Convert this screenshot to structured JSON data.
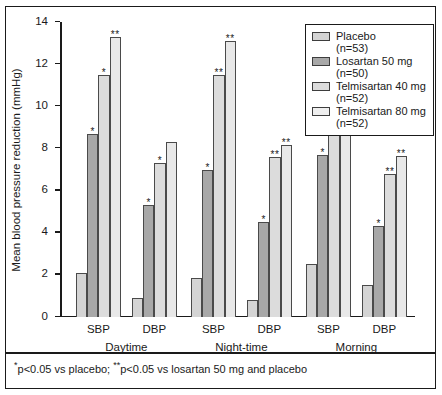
{
  "chart_data": {
    "type": "bar",
    "title": "",
    "xlabel": "",
    "ylabel": "Mean blood pressure reduction (mmHg)",
    "ylim": [
      0,
      14
    ],
    "yticks": [
      0,
      2,
      4,
      6,
      8,
      10,
      12,
      14
    ],
    "ytick_labels": [
      "0",
      "2",
      "4",
      "6",
      "8",
      "10",
      "12",
      "14"
    ],
    "grid": false,
    "legend_position": "top-right",
    "categories": [
      "Daytime SBP",
      "Daytime DBP",
      "Night-time SBP",
      "Night-time DBP",
      "Morning SBP",
      "Morning DBP"
    ],
    "groups": [
      {
        "name": "Daytime",
        "measures": [
          "SBP",
          "DBP"
        ]
      },
      {
        "name": "Night-time",
        "measures": [
          "SBP",
          "DBP"
        ]
      },
      {
        "name": "Morning",
        "measures": [
          "SBP",
          "DBP"
        ]
      }
    ],
    "series": [
      {
        "name": "Placebo",
        "n_label": "(n=53)",
        "color": "#d4d4d4",
        "values": [
          2.1,
          0.9,
          1.85,
          0.8,
          2.5,
          1.5
        ],
        "significance": [
          "",
          "",
          "",
          "",
          "",
          ""
        ]
      },
      {
        "name": "Losartan 50 mg",
        "n_label": "(n=50)",
        "color": "#a8a8a8",
        "values": [
          8.7,
          5.3,
          7.0,
          4.5,
          7.7,
          4.3
        ],
        "significance": [
          "*",
          "*",
          "*",
          "*",
          "*",
          "*"
        ]
      },
      {
        "name": "Telmisartan 40 mg",
        "n_label": "(n=52)",
        "color": "#dcdcdc",
        "values": [
          11.5,
          7.3,
          11.5,
          7.6,
          10.55,
          6.8
        ],
        "significance": [
          "*",
          "*",
          "**",
          "**",
          "*",
          "**"
        ]
      },
      {
        "name": "Telmisartan 80 mg",
        "n_label": "(n=52)",
        "color": "#e8e8e8",
        "values": [
          13.3,
          8.3,
          13.1,
          8.15,
          12.7,
          7.65
        ],
        "significance": [
          "**",
          "",
          "**",
          "**",
          "**",
          "**"
        ]
      }
    ],
    "footnote": "p<0.05 vs placebo; ",
    "footnote_mark_1": "*",
    "footnote_mark_2": "**",
    "footnote_tail": "p<0.05 vs losartan 50 mg and placebo"
  }
}
